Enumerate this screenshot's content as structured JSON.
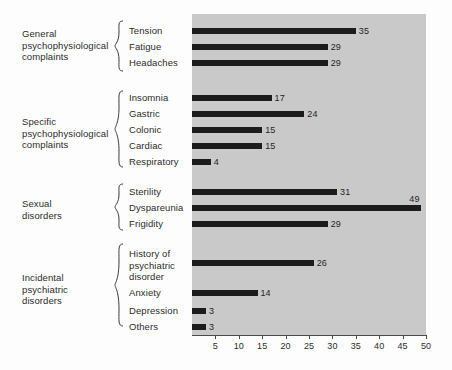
{
  "figure": {
    "background": "#fdfdfd",
    "plot_background": "#c9c9c9",
    "bar_color": "#1c1c1c",
    "axis_color": "#4a4a4a"
  },
  "groups": [
    {
      "label": "General\npsychophysiological\ncomplaints",
      "top": 28,
      "brace_top": 20,
      "brace_height": 52
    },
    {
      "label": "Specific\npsychophysiological\ncomplaints",
      "top": 116,
      "brace_top": 90,
      "brace_height": 78
    },
    {
      "label": "Sexual\ndisorders",
      "top": 198,
      "brace_top": 183,
      "brace_height": 48
    },
    {
      "label": "Incidental\npsychiatric\ndisorders",
      "top": 272,
      "brace_top": 243,
      "brace_height": 84
    }
  ],
  "chart_data": {
    "type": "bar",
    "orientation": "horizontal",
    "title": "",
    "xlabel": "",
    "ylabel": "",
    "xlim": [
      0,
      50
    ],
    "xticks": [
      5,
      10,
      15,
      20,
      25,
      30,
      35,
      40,
      45,
      50
    ],
    "grid": false,
    "legend": false,
    "categories": [
      "Tension",
      "Fatigue",
      "Headaches",
      "Insomnia",
      "Gastric",
      "Colonic",
      "Cardiac",
      "Respiratory",
      "Sterility",
      "Dyspareunia",
      "Frigidity",
      "History of\npsychiatric\ndisorder",
      "Anxiety",
      "Depression",
      "Others"
    ],
    "values": [
      35,
      29,
      29,
      17,
      24,
      15,
      15,
      4,
      31,
      49,
      29,
      26,
      14,
      3,
      3
    ],
    "groups": [
      {
        "name": "General psychophysiological complaints",
        "members": [
          "Tension",
          "Fatigue",
          "Headaches"
        ]
      },
      {
        "name": "Specific psychophysiological complaints",
        "members": [
          "Insomnia",
          "Gastric",
          "Colonic",
          "Cardiac",
          "Respiratory"
        ]
      },
      {
        "name": "Sexual disorders",
        "members": [
          "Sterility",
          "Dyspareunia",
          "Frigidity"
        ]
      },
      {
        "name": "Incidental psychiatric disorders",
        "members": [
          "History of psychiatric disorder",
          "Anxiety",
          "Depression",
          "Others"
        ]
      }
    ]
  },
  "rows": [
    {
      "label": "Tension",
      "value": 35,
      "label_top": 25,
      "bar_top": 28,
      "label_above": false
    },
    {
      "label": "Fatigue",
      "value": 29,
      "label_top": 41,
      "bar_top": 44,
      "label_above": false
    },
    {
      "label": "Headaches",
      "value": 29,
      "label_top": 57,
      "bar_top": 60,
      "label_above": false
    },
    {
      "label": "Insomnia",
      "value": 17,
      "label_top": 92,
      "bar_top": 95,
      "label_above": false
    },
    {
      "label": "Gastric",
      "value": 24,
      "label_top": 108,
      "bar_top": 111,
      "label_above": false
    },
    {
      "label": "Colonic",
      "value": 15,
      "label_top": 124,
      "bar_top": 127,
      "label_above": false
    },
    {
      "label": "Cardiac",
      "value": 15,
      "label_top": 140,
      "bar_top": 143,
      "label_above": false
    },
    {
      "label": "Respiratory",
      "value": 4,
      "label_top": 156,
      "bar_top": 159,
      "label_above": false
    },
    {
      "label": "Sterility",
      "value": 31,
      "label_top": 186,
      "bar_top": 189,
      "label_above": false
    },
    {
      "label": "Dyspareunia",
      "value": 49,
      "label_top": 202,
      "bar_top": 205,
      "label_above": true
    },
    {
      "label": "Frigidity",
      "value": 29,
      "label_top": 218,
      "bar_top": 221,
      "label_above": false
    },
    {
      "label": "History of\npsychiatric\ndisorder",
      "value": 26,
      "label_top": 248,
      "bar_top": 260,
      "label_above": false
    },
    {
      "label": "Anxiety",
      "value": 14,
      "label_top": 287,
      "bar_top": 290,
      "label_above": false
    },
    {
      "label": "Depression",
      "value": 3,
      "label_top": 305,
      "bar_top": 308,
      "label_above": false
    },
    {
      "label": "Others",
      "value": 3,
      "label_top": 321,
      "bar_top": 324,
      "label_above": false
    }
  ]
}
